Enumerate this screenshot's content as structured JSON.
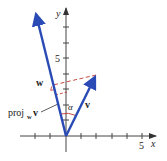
{
  "diagram": {
    "type": "vector-projection",
    "axes": {
      "x_label": "x",
      "y_label": "y",
      "x_tick_label": "5",
      "y_tick_label": "5",
      "x_range": [
        -4,
        6
      ],
      "y_range": [
        -2,
        9
      ]
    },
    "vectors": [
      {
        "name": "w",
        "label": "w",
        "components": [
          -2,
          8
        ],
        "color": "#2a4bb5"
      },
      {
        "name": "v",
        "label": "v",
        "components": [
          2,
          4
        ],
        "color": "#2a4bb5"
      }
    ],
    "projection": {
      "label_main": "proj",
      "label_sub": "w",
      "label_vec": "v",
      "point": [
        -0.82,
        3.29
      ],
      "dash_color": "#c0392b"
    },
    "angle": {
      "label": "α",
      "color": "#c0392b"
    }
  }
}
